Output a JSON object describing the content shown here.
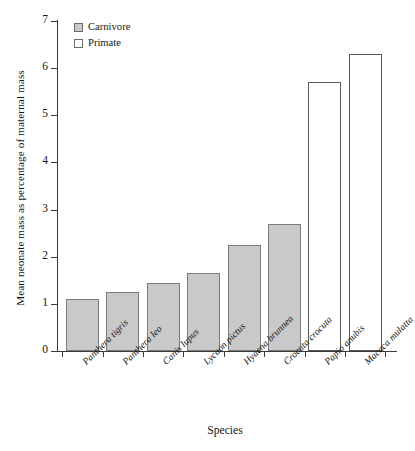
{
  "chart_data": {
    "type": "bar",
    "title": "",
    "xlabel": "Species",
    "ylabel": "Mean neonate mass as percentage of maternal mass",
    "ylim": [
      0,
      7
    ],
    "yticks": [
      "0",
      "1",
      "2",
      "3",
      "4",
      "5",
      "6",
      "7"
    ],
    "grid": false,
    "legend_position": "top-left inside plot",
    "categories": [
      "Panthera tigris",
      "Panthera leo",
      "Canis lupus",
      "Lycaon pictus",
      "Hyaena brunnea",
      "Crocuta crocuta",
      "Papio anubis",
      "Macaca mulatta"
    ],
    "values": [
      1.1,
      1.25,
      1.45,
      1.65,
      2.25,
      2.7,
      5.7,
      6.3
    ],
    "groups": [
      "Carnivore",
      "Carnivore",
      "Carnivore",
      "Carnivore",
      "Carnivore",
      "Carnivore",
      "Primate",
      "Primate"
    ],
    "series": [
      {
        "name": "Carnivore",
        "color": "#c9c9c9",
        "points": [
          {
            "category": "Panthera tigris",
            "value": 1.1
          },
          {
            "category": "Panthera leo",
            "value": 1.25
          },
          {
            "category": "Canis lupus",
            "value": 1.45
          },
          {
            "category": "Lycaon pictus",
            "value": 1.65
          },
          {
            "category": "Hyaena brunnea",
            "value": 2.25
          },
          {
            "category": "Crocuta crocuta",
            "value": 2.7
          }
        ]
      },
      {
        "name": "Primate",
        "color": "#ffffff",
        "points": [
          {
            "category": "Papio anubis",
            "value": 5.7
          },
          {
            "category": "Macaca mulatta",
            "value": 6.3
          }
        ]
      }
    ],
    "legend": [
      {
        "label": "Carnivore",
        "swatch": "#c9c9c9"
      },
      {
        "label": "Primate",
        "swatch": "#ffffff"
      }
    ]
  },
  "colors": {
    "carnivore_fill": "#c9c9c9",
    "primate_fill": "#ffffff",
    "bar_border": "#6d6d6d",
    "axis": "#3a3a3a",
    "text": "#141414",
    "background": "#ffffff"
  }
}
